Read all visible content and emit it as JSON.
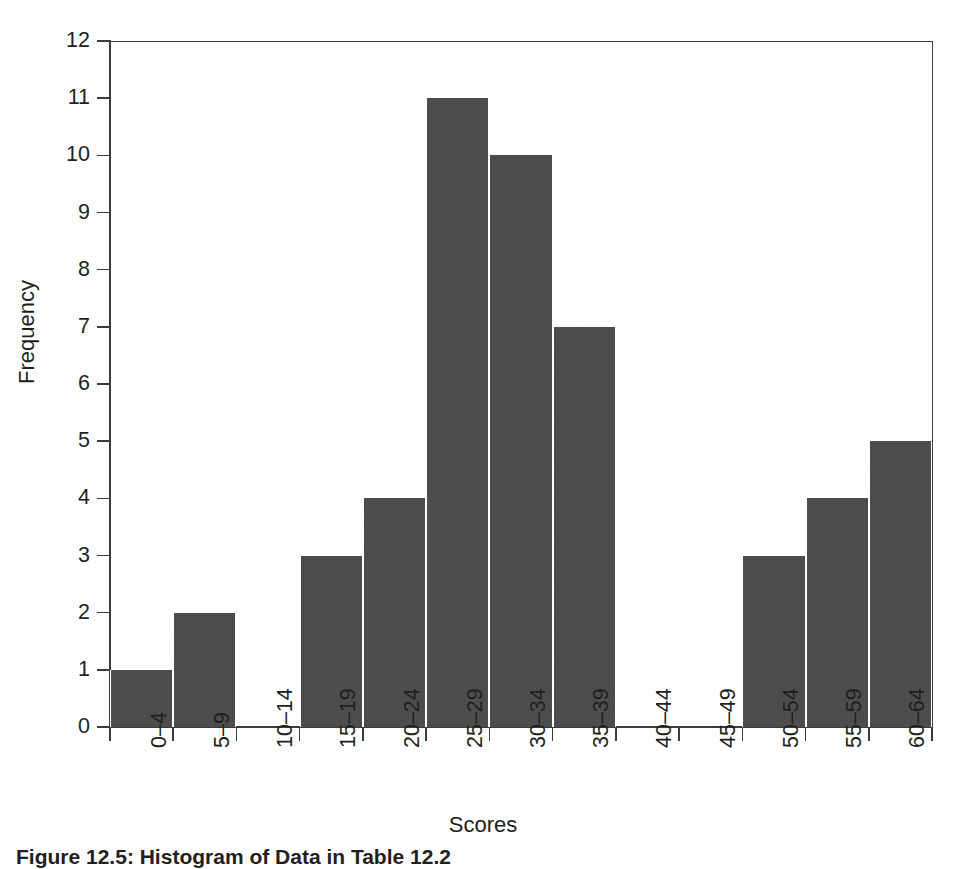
{
  "figure": {
    "caption": "Figure 12.5: Histogram of Data in Table 12.2"
  },
  "chart_data": {
    "type": "bar",
    "title": "",
    "xlabel": "Scores",
    "ylabel": "Frequency",
    "categories": [
      "0–44",
      "5–9",
      "10–14",
      "15–19",
      "20–24",
      "25–29",
      "30–34",
      "35–39",
      "40–44",
      "45–49",
      "50–54",
      "55–59",
      "60–64"
    ],
    "values": [
      1,
      2,
      0,
      3,
      4,
      11,
      10,
      7,
      0,
      0,
      3,
      4,
      5
    ],
    "ylim": [
      0,
      12
    ],
    "yticks": [
      0,
      1,
      2,
      3,
      4,
      5,
      6,
      7,
      8,
      9,
      10,
      11,
      12
    ],
    "ytick_labels": [
      "0",
      "1",
      "2",
      "3",
      "4",
      "5",
      "6",
      "7",
      "8",
      "9",
      "10",
      "11",
      "12"
    ],
    "grid": false,
    "legend": false,
    "bar_color": "#4a4a4a",
    "axis_color": "#3c3c3c",
    "background": "#ffffff",
    "x_tick_rotation": -90
  },
  "axis": {
    "x_title": "Scores",
    "y_title": "Frequency"
  },
  "x_categories": [
    {
      "label": "0–4"
    },
    {
      "label": "5–9"
    },
    {
      "label": "10–14"
    },
    {
      "label": "15–19"
    },
    {
      "label": "20–24"
    },
    {
      "label": "25–29"
    },
    {
      "label": "30–34"
    },
    {
      "label": "35–39"
    },
    {
      "label": "40–44"
    },
    {
      "label": "45–49"
    },
    {
      "label": "50–54"
    },
    {
      "label": "55–59"
    },
    {
      "label": "60–64"
    }
  ],
  "y_ticks": [
    {
      "label": "0"
    },
    {
      "label": "1"
    },
    {
      "label": "2"
    },
    {
      "label": "3"
    },
    {
      "label": "4"
    },
    {
      "label": "5"
    },
    {
      "label": "6"
    },
    {
      "label": "7"
    },
    {
      "label": "8"
    },
    {
      "label": "9"
    },
    {
      "label": "10"
    },
    {
      "label": "11"
    },
    {
      "label": "12"
    }
  ]
}
